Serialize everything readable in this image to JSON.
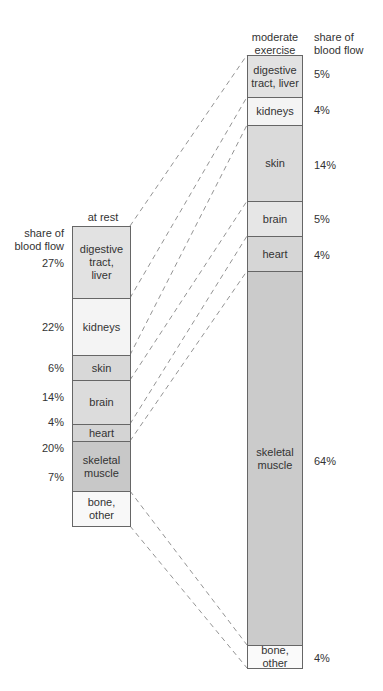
{
  "left": {
    "header": "at rest",
    "axis_label": "share of\nblood flow",
    "segments": [
      {
        "label": "digestive\ntract,\nliver",
        "pct": "27%",
        "color": "#e2e2e2"
      },
      {
        "label": "kidneys",
        "pct": "22%",
        "color": "#f4f4f4"
      },
      {
        "label": "skin",
        "pct": "6%",
        "color": "#d8d8d8"
      },
      {
        "label": "brain",
        "pct": "14%",
        "color": "#dcdcdc"
      },
      {
        "label": "heart",
        "pct": "4%",
        "color": "#d4d4d4"
      },
      {
        "label": "skeletal\nmuscle",
        "pct": "20%",
        "color": "#c8c8c8"
      },
      {
        "label": "bone,\nother",
        "pct": "7%",
        "color": "#f8f8f8"
      }
    ]
  },
  "right": {
    "header": "moderate\nexercise",
    "axis_label": "share of\nblood flow",
    "segments": [
      {
        "label": "digestive\ntract, liver",
        "pct": "5%",
        "color": "#e2e2e2"
      },
      {
        "label": "kidneys",
        "pct": "4%",
        "color": "#f4f4f4"
      },
      {
        "label": "skin",
        "pct": "14%",
        "color": "#dadada"
      },
      {
        "label": "brain",
        "pct": "5%",
        "color": "#e6e6e6"
      },
      {
        "label": "heart",
        "pct": "4%",
        "color": "#d6d6d6"
      },
      {
        "label": "skeletal\nmuscle",
        "pct": "64%",
        "color": "#cbcbcb"
      },
      {
        "label": "bone,\nother",
        "pct": "4%",
        "color": "#fafafa"
      }
    ]
  }
}
